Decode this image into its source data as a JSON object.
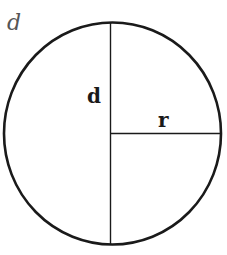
{
  "diagram": {
    "title": "d",
    "labels": {
      "diameter": "d",
      "radius": "r"
    },
    "colors": {
      "stroke": "#1a1a1a",
      "title": "#555555",
      "background": "#ffffff"
    },
    "shape": "circle",
    "elements": [
      "circle",
      "vertical diameter line",
      "horizontal radius line"
    ]
  }
}
